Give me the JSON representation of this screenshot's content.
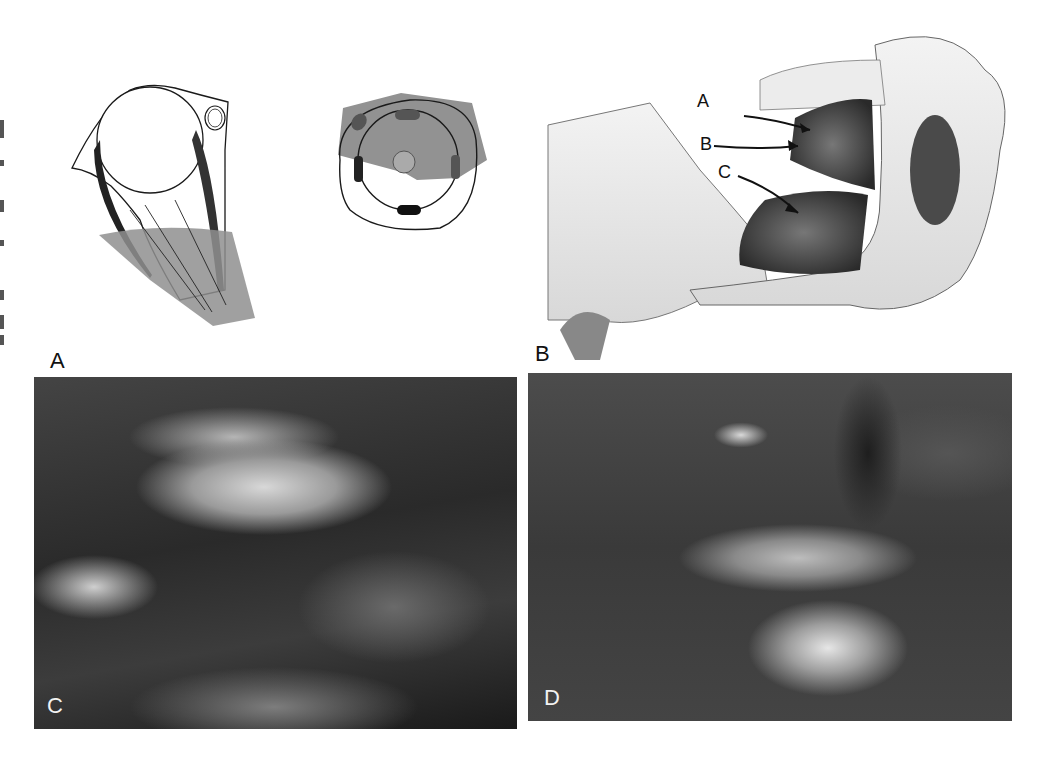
{
  "figure": {
    "panels": [
      {
        "id": "A",
        "label": "A",
        "description": "Schematic cross-section with circular structure, dark bands and grey shaded wedge"
      },
      {
        "id": "A2",
        "label": "",
        "description": "Schematic ring with four dark oval markers and grey shaded polygon"
      },
      {
        "id": "B",
        "label": "B",
        "description": "Anatomical line drawing with arrows labeled A, B, C"
      },
      {
        "id": "C",
        "label": "C",
        "description": "Intraoperative photograph"
      },
      {
        "id": "D",
        "label": "D",
        "description": "Intraoperative photograph"
      }
    ],
    "arrow_labels": [
      "A",
      "B",
      "C"
    ],
    "colors": {
      "shade": "#8f8f8f",
      "dark_band": "#222222",
      "line": "#1a1a1a",
      "photo_dark": "#2a2a2a"
    }
  }
}
